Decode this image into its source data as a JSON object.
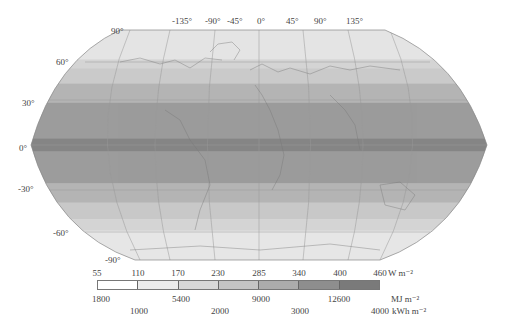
{
  "map": {
    "projection": "Robinson",
    "longitude_labels": [
      "-135°",
      "-90°",
      "-45°",
      "0°",
      "45°",
      "90°",
      "135°"
    ],
    "latitude_labels": [
      "90°",
      "60°",
      "30°",
      "0°",
      "-30°",
      "-60°",
      "-90°"
    ],
    "bands": [
      {
        "lat_from": 90,
        "lat_to": 67,
        "color": "#e4e4e4"
      },
      {
        "lat_from": 67,
        "lat_to": 60,
        "color": "#d4d4d4"
      },
      {
        "lat_from": 60,
        "lat_to": 48,
        "color": "#cacaca"
      },
      {
        "lat_from": 48,
        "lat_to": 33,
        "color": "#b4b4b4"
      },
      {
        "lat_from": 33,
        "lat_to": 5,
        "color": "#9c9c9c"
      },
      {
        "lat_from": 5,
        "lat_to": -5,
        "color": "#858585"
      },
      {
        "lat_from": -5,
        "lat_to": -30,
        "color": "#9c9c9c"
      },
      {
        "lat_from": -30,
        "lat_to": -45,
        "color": "#b4b4b4"
      },
      {
        "lat_from": -45,
        "lat_to": -58,
        "color": "#c8c8c8"
      },
      {
        "lat_from": -58,
        "lat_to": -67,
        "color": "#d4d4d4"
      },
      {
        "lat_from": -67,
        "lat_to": -90,
        "color": "#e6e6e6"
      }
    ]
  },
  "legend": {
    "w_values": [
      "55",
      "110",
      "170",
      "230",
      "285",
      "340",
      "400",
      "460"
    ],
    "w_unit": "W m⁻²",
    "mj_values": [
      "1800",
      "5400",
      "9000",
      "12600"
    ],
    "mj_unit": "MJ m⁻²",
    "kwh_values": [
      "1000",
      "2000",
      "3000",
      "4000"
    ],
    "kwh_unit": "kWh m⁻²",
    "segment_colors": [
      "#ffffff",
      "#ebebeb",
      "#d8d8d8",
      "#c4c4c4",
      "#acacac",
      "#8e8e8e",
      "#7a7a7a"
    ]
  }
}
